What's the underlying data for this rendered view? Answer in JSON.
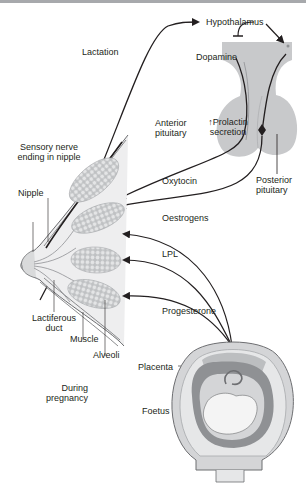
{
  "labels": {
    "hypothalamus": "Hypothalamus",
    "dopamine": "Dopamine",
    "prolactin_line1": "↑Prolactin",
    "prolactin_line2": "secretion",
    "anterior_line1": "Anterior",
    "anterior_line2": "pituitary",
    "posterior_line1": "Posterior",
    "posterior_line2": "pituitary",
    "lactation": "Lactation",
    "sensory_line1": "Sensory nerve",
    "sensory_line2": "ending in nipple",
    "nipple": "Nipple",
    "oxytocin": "Oxytocin",
    "oestrogens": "Oestrogens",
    "lpl": "LPL",
    "progesterone": "Progesterone",
    "lactiferous_line1": "Lactiferous",
    "lactiferous_line2": "duct",
    "muscle": "Muscle",
    "alveoli": "Alveoli",
    "during_line1": "During",
    "during_line2": "pregnancy",
    "placenta": "Placenta",
    "foetus": "Foetus"
  },
  "colors": {
    "gland": "#c8c9cb",
    "band": "#d4d5d7",
    "line": "#231f20",
    "alveoli": "#cfd0d2",
    "uterus": "#bcbec0",
    "uterus_dark": "#8f9194"
  }
}
